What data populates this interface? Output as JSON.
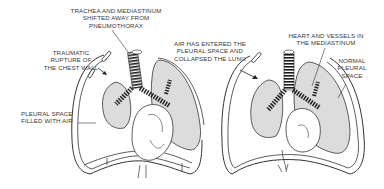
{
  "diagram": {
    "type": "medical-illustration",
    "colors": {
      "lung_fill": "#dcdcdc",
      "outline": "#333333",
      "background": "#ffffff",
      "text": "#3a3a3a"
    },
    "panels": [
      {
        "id": "left",
        "description": "Chest with traumatic pneumothorax; lung collapsed, mediastinum shifted",
        "labels": [
          {
            "id": "trachea-shift",
            "text": "TRACHEA AND MEDIASTINUM\nSHIFTED AWAY FROM\nPNEUMOTHORAX"
          },
          {
            "id": "traumatic-rupture",
            "text": "TRAUMATIC\nRUPTURE OF\nTHE CHEST WALL"
          },
          {
            "id": "pleural-air",
            "text": "PLEURAL SPACE\nFILLED WITH AIR"
          }
        ]
      },
      {
        "id": "right",
        "description": "Chest with air entering pleural space on one side, normal pleural space on other",
        "labels": [
          {
            "id": "air-entered",
            "text": "AIR HAS ENTERED THE\nPLEURAL SPACE AND\nCOLLAPSED THE LUNG"
          },
          {
            "id": "heart-vessels",
            "text": "HEART AND VESSELS IN\nTHE MEDIASTINUM"
          },
          {
            "id": "normal-pleural",
            "text": "NORMAL\nPLEURAL\nSPACE"
          }
        ]
      }
    ]
  }
}
